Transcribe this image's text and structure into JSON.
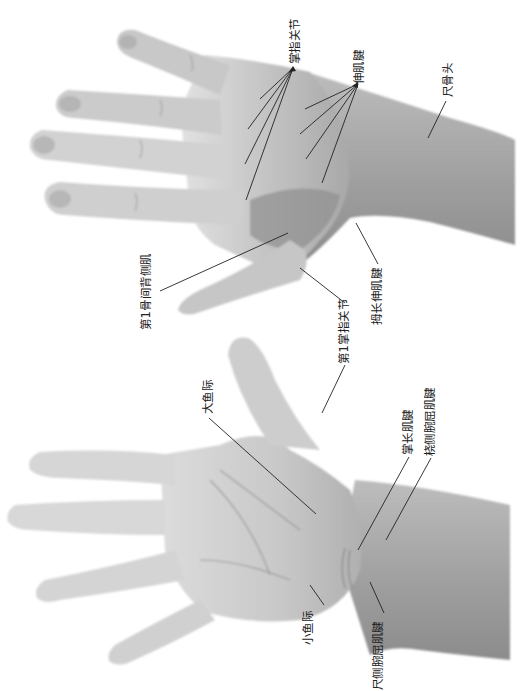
{
  "figure": {
    "colors": {
      "background": "#ffffff",
      "skin_light": "#d9d9d9",
      "skin_mid": "#b5b5b5",
      "skin_dark": "#8a8a8a",
      "leader_line": "#222222",
      "label_text": "#222222"
    }
  },
  "dorsal_view": {
    "labels": {
      "mcp_joints": "掌指关节",
      "extensor_tendons": "伸肌腱",
      "ulnar_head": "尺骨头",
      "first_dorsal_interosseous": "第1骨间背侧肌",
      "extensor_pollicis_longus": "拇长伸肌腱",
      "first_mcp_joint": "第1掌指关节"
    }
  },
  "palmar_view": {
    "labels": {
      "thenar_eminence": "大鱼际",
      "palmaris_longus": "掌长肌腱",
      "flexor_carpi_radialis": "桡侧腕屈肌腱",
      "hypothenar_eminence": "小鱼际",
      "flexor_carpi_ulnaris": "尺侧腕屈肌腱"
    }
  }
}
